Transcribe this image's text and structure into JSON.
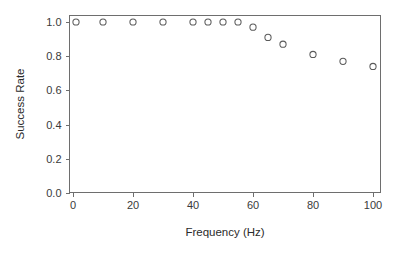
{
  "chart_data": {
    "type": "scatter",
    "title": "",
    "xlabel": "Frequency (Hz)",
    "ylabel": "Success Rate",
    "xlim": [
      -4,
      104
    ],
    "ylim": [
      -0.04,
      1.06
    ],
    "xticks": [
      0,
      20,
      40,
      60,
      80,
      100
    ],
    "xticklabels": [
      "0",
      "20",
      "40",
      "60",
      "80",
      "100"
    ],
    "yticks": [
      0.0,
      0.2,
      0.4,
      0.6,
      0.8,
      1.0
    ],
    "yticklabels": [
      "0.0",
      "0.2",
      "0.4",
      "0.6",
      "0.8",
      "1.0"
    ],
    "grid": false,
    "legend": null,
    "marker": "open-circle",
    "marker_color": "#5a5a5a",
    "series": [
      {
        "name": "Success Rate",
        "x": [
          1,
          10,
          20,
          30,
          40,
          45,
          50,
          55,
          60,
          65,
          70,
          80,
          90,
          100
        ],
        "y": [
          1.0,
          1.0,
          1.0,
          1.0,
          1.0,
          1.0,
          1.0,
          1.0,
          0.97,
          0.91,
          0.87,
          0.81,
          0.77,
          0.74
        ]
      }
    ]
  },
  "figure": {
    "background_color": "#ffffff",
    "frame_color": "#6e6e6e",
    "text_color": "#2b2b2b"
  }
}
